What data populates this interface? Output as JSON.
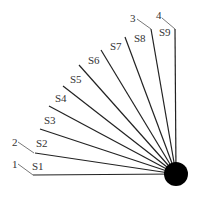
{
  "diagram": {
    "hub": {
      "cx": 176,
      "cy": 174,
      "r": 12,
      "color": "#000000"
    },
    "line_color": "#222222",
    "leader_color": "#555555",
    "lines": [
      {
        "id": "S1",
        "label": "S1",
        "x": 33,
        "y": 175,
        "lx": 32,
        "ly": 170
      },
      {
        "id": "S2",
        "label": "S2",
        "x": 35,
        "y": 153,
        "lx": 36,
        "ly": 147
      },
      {
        "id": "S3",
        "label": "S3",
        "x": 40,
        "y": 129,
        "lx": 44,
        "ly": 124
      },
      {
        "id": "S4",
        "label": "S4",
        "x": 49,
        "y": 106,
        "lx": 55,
        "ly": 102
      },
      {
        "id": "S5",
        "label": "S5",
        "x": 63,
        "y": 86,
        "lx": 70,
        "ly": 83
      },
      {
        "id": "S6",
        "label": "S6",
        "x": 79,
        "y": 65,
        "lx": 88,
        "ly": 64
      },
      {
        "id": "S7",
        "label": "S7",
        "x": 101,
        "y": 50,
        "lx": 110,
        "ly": 50
      },
      {
        "id": "S8",
        "label": "S8",
        "x": 125,
        "y": 37,
        "lx": 134,
        "ly": 42
      },
      {
        "id": "S9",
        "label": "",
        "x": 151,
        "y": 29,
        "lx": 0,
        "ly": 0
      },
      {
        "id": "L4",
        "label": "",
        "x": 175,
        "y": 29,
        "lx": 0,
        "ly": 0
      }
    ],
    "s9_label": {
      "text": "S9",
      "x": 159,
      "y": 36
    },
    "callouts": [
      {
        "label": "1",
        "tx": 12,
        "ty": 168,
        "x1": 18,
        "y1": 164,
        "x2": 33,
        "y2": 175
      },
      {
        "label": "2",
        "tx": 12,
        "ty": 146,
        "x1": 18,
        "y1": 142,
        "x2": 34,
        "y2": 153
      },
      {
        "label": "3",
        "tx": 130,
        "ty": 22,
        "x1": 137,
        "y1": 19,
        "x2": 151,
        "y2": 29
      },
      {
        "label": "4",
        "tx": 156,
        "ty": 19,
        "x1": 162,
        "y1": 18,
        "x2": 175,
        "y2": 29
      }
    ]
  }
}
